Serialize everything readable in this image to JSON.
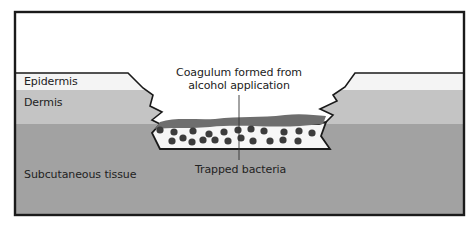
{
  "diagram": {
    "type": "skin-cross-section",
    "layers": [
      {
        "name": "Epidermis",
        "color": "#f4f4f4"
      },
      {
        "name": "Dermis",
        "color": "#c4c4c4"
      },
      {
        "name": "Subcutaneous tissue",
        "color": "#a2a2a2"
      }
    ],
    "labels": {
      "epidermis": "Epidermis",
      "dermis": "Dermis",
      "subcutaneous": "Subcutaneous tissue",
      "coagulum_line1": "Coagulum formed from",
      "coagulum_line2": "alcohol application",
      "bacteria": "Trapped bacteria"
    },
    "colors": {
      "frame": "#1a1a1a",
      "coagulum": "#6e6e6e",
      "bacteria": "#3c3c3c",
      "pocket": "#f6f6f6",
      "sky": "#ffffff"
    }
  }
}
